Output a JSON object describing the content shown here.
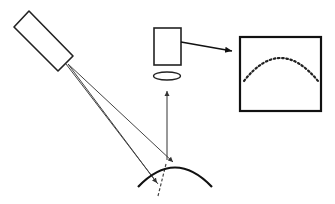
{
  "diagram": {
    "type": "optical-measurement-schematic",
    "components": [
      {
        "id": "light-source",
        "shape": "tilted-rectangle"
      },
      {
        "id": "camera",
        "shape": "rectangle"
      },
      {
        "id": "lens",
        "shape": "ellipse"
      },
      {
        "id": "display-screen",
        "shape": "square",
        "content": "dotted-arc"
      },
      {
        "id": "curved-surface",
        "shape": "arc"
      }
    ],
    "colors": {
      "stroke": "#111111",
      "ray": "#444444",
      "background": "#ffffff"
    }
  }
}
